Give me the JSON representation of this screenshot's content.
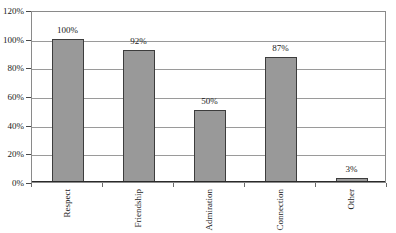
{
  "chart_data": {
    "type": "bar",
    "title": "",
    "xlabel": "",
    "ylabel": "",
    "categories": [
      "Respect",
      "Friendship",
      "Admiration",
      "Connection",
      "Other"
    ],
    "values": [
      100,
      92,
      50,
      87,
      3
    ],
    "data_labels": [
      "100%",
      "92%",
      "50%",
      "87%",
      "3%"
    ],
    "ylim": [
      0,
      120
    ],
    "ytick_values": [
      0,
      20,
      40,
      60,
      80,
      100,
      120
    ],
    "ytick_labels": [
      "0%",
      "20%",
      "40%",
      "60%",
      "80%",
      "100%",
      "120%"
    ],
    "grid": "horizontal",
    "legend": "none",
    "series_name": "",
    "bar_color": "#999999",
    "bar_border_color": "#3d3d3d",
    "gridline_color": "#9a9a9a",
    "frame_color": "#8a8a8a",
    "axis_color": "#2a2a2a",
    "text_color": "#1a1a1a",
    "background_color": "#ffffff"
  }
}
